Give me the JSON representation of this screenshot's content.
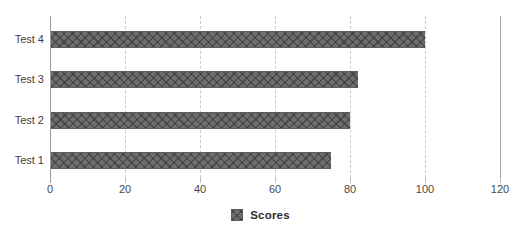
{
  "chart_data": {
    "type": "bar",
    "orientation": "horizontal",
    "title": "",
    "xlabel": "",
    "ylabel": "",
    "categories": [
      "Test 1",
      "Test 2",
      "Test 3",
      "Test 4"
    ],
    "values": [
      75,
      80,
      82,
      100
    ],
    "series": [
      {
        "name": "Scores",
        "values": [
          75,
          80,
          82,
          100
        ]
      }
    ],
    "xlim": [
      0,
      120
    ],
    "xticks": [
      0,
      20,
      40,
      60,
      80,
      100,
      120
    ],
    "xtick_labels": [
      "0",
      "20",
      "40",
      "60",
      "80",
      "100",
      "120"
    ],
    "grid": "vertical-dashed",
    "legend_position": "bottom-center",
    "legend_entries": [
      "Scores"
    ],
    "colors": {
      "bar_fill": "#6e6e6e",
      "bar_hatch": "#373737",
      "bar_edge": "#5d5d5d",
      "gridline": "#c9c9c9",
      "axis_line": "#9a9a9a",
      "right_border_line": "#a8a8a8",
      "tick_label": "#4a4a4a",
      "category_label": "#3f3f3f",
      "legend_text": "#2d2d2d",
      "background": "#ffffff"
    }
  },
  "legend": {
    "swatch_name": "scores-hatched-swatch",
    "label": "Scores"
  }
}
